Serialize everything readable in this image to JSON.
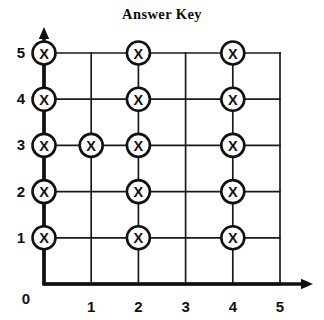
{
  "chart_data": {
    "type": "scatter",
    "title": "Answer Key",
    "xlabel": "",
    "ylabel": "",
    "xlim": [
      0,
      5
    ],
    "ylim": [
      0,
      5
    ],
    "x_ticks": [
      "0",
      "1",
      "2",
      "3",
      "4",
      "5"
    ],
    "y_ticks": [
      "0",
      "1",
      "2",
      "3",
      "4",
      "5"
    ],
    "grid": true,
    "legend": null,
    "marker": "circled-x",
    "points": [
      {
        "x": 0,
        "y": 1
      },
      {
        "x": 0,
        "y": 2
      },
      {
        "x": 0,
        "y": 3
      },
      {
        "x": 0,
        "y": 4
      },
      {
        "x": 0,
        "y": 5
      },
      {
        "x": 1,
        "y": 3
      },
      {
        "x": 2,
        "y": 1
      },
      {
        "x": 2,
        "y": 2
      },
      {
        "x": 2,
        "y": 3
      },
      {
        "x": 2,
        "y": 4
      },
      {
        "x": 2,
        "y": 5
      },
      {
        "x": 4,
        "y": 1
      },
      {
        "x": 4,
        "y": 2
      },
      {
        "x": 4,
        "y": 3
      },
      {
        "x": 4,
        "y": 4
      },
      {
        "x": 4,
        "y": 5
      }
    ],
    "marker_label": "X",
    "axis_arrows": [
      "x-positive",
      "y-positive"
    ],
    "colors": {
      "background": "#ffffff",
      "axis": "#111111",
      "grid": "#1a1a1a",
      "marker_stroke": "#111111",
      "marker_fill": "#ffffff",
      "text": "#0d0d0d"
    }
  },
  "geometry": {
    "origin_x": 44,
    "origin_y": 284,
    "step_x": 47.2,
    "step_y": 46.2,
    "marker_radius": 11.5,
    "x_axis_arrow_end": 313,
    "y_axis_arrow_end": 27
  }
}
